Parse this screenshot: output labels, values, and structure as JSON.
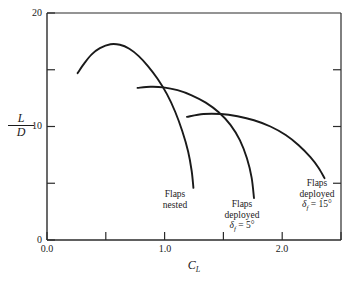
{
  "chart_data": {
    "type": "line",
    "title": "",
    "xlabel": "C_L",
    "ylabel": "L/D",
    "xlim": [
      0.0,
      2.5
    ],
    "ylim": [
      0,
      20
    ],
    "grid": false,
    "legend_position": "inline-annotations",
    "x_ticks": [
      {
        "value": 0.0,
        "label": "0.0",
        "major": true
      },
      {
        "value": 0.5,
        "label": "",
        "major": false
      },
      {
        "value": 1.0,
        "label": "1.0",
        "major": true
      },
      {
        "value": 1.5,
        "label": "",
        "major": false
      },
      {
        "value": 2.0,
        "label": "2.0",
        "major": true
      },
      {
        "value": 2.5,
        "label": "",
        "major": false
      }
    ],
    "y_ticks": [
      {
        "value": 0,
        "label": "0",
        "major": true
      },
      {
        "value": 5,
        "label": "",
        "major": false
      },
      {
        "value": 10,
        "label": "10",
        "major": true
      },
      {
        "value": 15,
        "label": "",
        "major": false
      },
      {
        "value": 20,
        "label": "20",
        "major": true
      }
    ],
    "series": [
      {
        "name": "Flaps nested",
        "annotation_lines": [
          "Flaps",
          "nested"
        ],
        "points": [
          [
            0.26,
            14.7
          ],
          [
            0.32,
            15.6
          ],
          [
            0.38,
            16.35
          ],
          [
            0.45,
            16.9
          ],
          [
            0.54,
            17.25
          ],
          [
            0.62,
            17.2
          ],
          [
            0.7,
            16.85
          ],
          [
            0.78,
            16.2
          ],
          [
            0.86,
            15.3
          ],
          [
            0.94,
            14.2
          ],
          [
            1.02,
            12.85
          ],
          [
            1.09,
            11.3
          ],
          [
            1.15,
            9.6
          ],
          [
            1.2,
            7.8
          ],
          [
            1.23,
            6.1
          ],
          [
            1.245,
            4.6
          ]
        ]
      },
      {
        "name": "Flaps deployed, delta_f = 5 deg",
        "annotation_lines": [
          "Flaps",
          "deployed"
        ],
        "annotation_symbol": "δ",
        "annotation_subscript": "f",
        "annotation_value": "= 5°",
        "points": [
          [
            0.77,
            13.4
          ],
          [
            0.88,
            13.5
          ],
          [
            0.99,
            13.45
          ],
          [
            1.11,
            13.2
          ],
          [
            1.23,
            12.75
          ],
          [
            1.35,
            12.1
          ],
          [
            1.46,
            11.25
          ],
          [
            1.56,
            10.15
          ],
          [
            1.64,
            8.8
          ],
          [
            1.7,
            7.2
          ],
          [
            1.74,
            5.5
          ],
          [
            1.76,
            3.7
          ]
        ]
      },
      {
        "name": "Flaps deployed, delta_f = 15 deg",
        "annotation_lines": [
          "Flaps",
          "deployed"
        ],
        "annotation_symbol": "δ",
        "annotation_subscript": "f",
        "annotation_value": "= 15°",
        "points": [
          [
            1.19,
            10.85
          ],
          [
            1.33,
            11.1
          ],
          [
            1.48,
            11.1
          ],
          [
            1.62,
            10.9
          ],
          [
            1.76,
            10.55
          ],
          [
            1.9,
            10.0
          ],
          [
            2.03,
            9.25
          ],
          [
            2.14,
            8.35
          ],
          [
            2.24,
            7.3
          ],
          [
            2.31,
            6.35
          ],
          [
            2.36,
            5.45
          ]
        ]
      }
    ]
  },
  "axis_titles": {
    "y_numerator": "L",
    "y_denominator": "D",
    "x_symbol": "C",
    "x_subscript": "L"
  },
  "colors": {
    "curve": "#1a1a1a",
    "axis": "#2b2b2b",
    "background": "#ffffff"
  }
}
